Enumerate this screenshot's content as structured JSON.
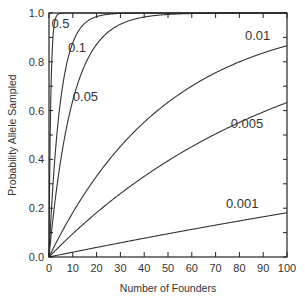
{
  "chart_data": {
    "type": "line",
    "title": "",
    "xlabel": "Number of Founders",
    "ylabel": "Probability Allele Sampled",
    "xlim": [
      0,
      100
    ],
    "ylim": [
      0.0,
      1.0
    ],
    "x_ticks": [
      "0",
      "10",
      "20",
      "30",
      "40",
      "50",
      "60",
      "70",
      "80",
      "90",
      "100"
    ],
    "y_ticks": [
      "0.0",
      "0.2",
      "0.4",
      "0.6",
      "0.8",
      "1.0"
    ],
    "grid": false,
    "legend": "inline curve labels",
    "formula_hint": "P = 1 - (1 - q)^(2N)",
    "x": [
      0,
      1,
      2,
      3,
      5,
      10,
      20,
      30,
      40,
      50,
      60,
      70,
      80,
      90,
      100
    ],
    "series": [
      {
        "name": "0.5",
        "q": 0.5,
        "values": [
          0,
          0.75,
          0.94,
          0.98,
          1.0,
          1.0,
          1.0,
          1.0,
          1.0,
          1.0,
          1.0,
          1.0,
          1.0,
          1.0,
          1.0
        ]
      },
      {
        "name": "0.1",
        "q": 0.1,
        "values": [
          0,
          0.19,
          0.34,
          0.47,
          0.65,
          0.88,
          0.99,
          1.0,
          1.0,
          1.0,
          1.0,
          1.0,
          1.0,
          1.0,
          1.0
        ]
      },
      {
        "name": "0.05",
        "q": 0.05,
        "values": [
          0,
          0.1,
          0.19,
          0.26,
          0.4,
          0.64,
          0.87,
          0.95,
          0.98,
          0.99,
          1.0,
          1.0,
          1.0,
          1.0,
          1.0
        ]
      },
      {
        "name": "0.01",
        "q": 0.01,
        "values": [
          0,
          0.02,
          0.04,
          0.06,
          0.1,
          0.18,
          0.33,
          0.45,
          0.55,
          0.63,
          0.7,
          0.75,
          0.8,
          0.84,
          0.87
        ]
      },
      {
        "name": "0.005",
        "q": 0.005,
        "values": [
          0,
          0.01,
          0.02,
          0.03,
          0.05,
          0.1,
          0.18,
          0.26,
          0.33,
          0.39,
          0.45,
          0.5,
          0.55,
          0.6,
          0.63
        ]
      },
      {
        "name": "0.001",
        "q": 0.001,
        "values": [
          0,
          0.002,
          0.004,
          0.006,
          0.01,
          0.02,
          0.04,
          0.06,
          0.08,
          0.1,
          0.11,
          0.13,
          0.15,
          0.16,
          0.18
        ]
      }
    ],
    "annotations": [
      {
        "text": "0.5",
        "x": 1,
        "y": 0.96
      },
      {
        "text": "0.1",
        "x": 8,
        "y": 0.86
      },
      {
        "text": "0.05",
        "x": 10,
        "y": 0.66
      },
      {
        "text": "0.01",
        "x": 93,
        "y": 0.91
      },
      {
        "text": "0.005",
        "x": 90,
        "y": 0.55
      },
      {
        "text": "0.001",
        "x": 88,
        "y": 0.22
      }
    ]
  }
}
